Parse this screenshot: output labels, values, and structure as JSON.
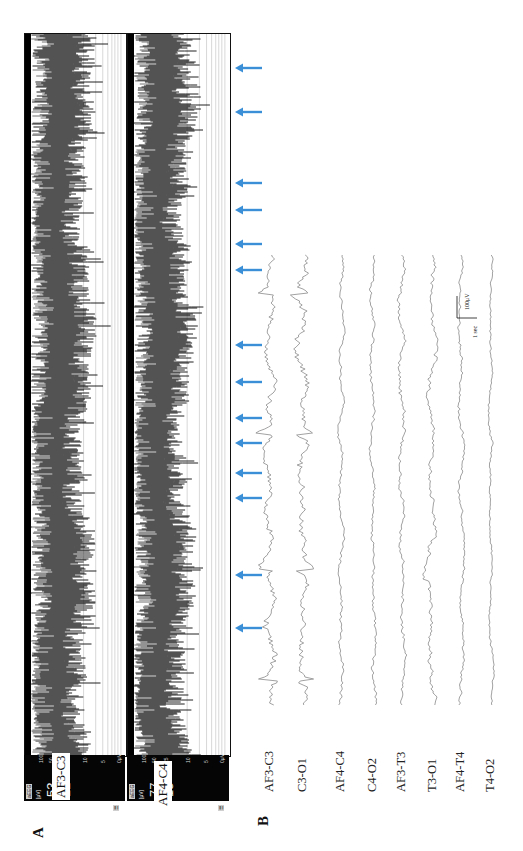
{
  "figure": {
    "panel_a_letter": "A",
    "panel_b_letter": "B",
    "orientation": "rotated -90deg"
  },
  "panel_a": {
    "channels": [
      {
        "id": "aeeg-1",
        "tag": "aEEG",
        "unit": "[μV]",
        "value_top": "53",
        "value_bottom": "12",
        "label": "AF3-C3",
        "icon_tag": "☰"
      },
      {
        "id": "aeeg-2",
        "tag": "aEEG",
        "unit": "[μV]",
        "value_top": "77",
        "value_bottom": "15",
        "label": "AF4-C4",
        "icon_tag": "☰"
      }
    ],
    "axis_ticks": [
      "100",
      "50",
      "25",
      "10",
      "5",
      "0μV"
    ]
  },
  "panel_b": {
    "channels": [
      "AF3-C3",
      "C3-O1",
      "AF4-C4",
      "C4-O2",
      "AF3-T3",
      "T3-O1",
      "AF4-T4",
      "T4-O2"
    ],
    "scale_bar": {
      "amplitude": "100μV",
      "time": "1 sec"
    }
  },
  "markers": {
    "color": "#3a8fd6",
    "arrow_y": [
      68,
      112,
      183,
      210,
      244,
      270,
      345,
      382,
      418,
      443,
      473,
      498,
      575,
      628
    ]
  },
  "chart_data": [
    {
      "type": "area",
      "title": "aEEG AF3-C3",
      "ylabel": "Amplitude (μV, log scale)",
      "y_ticks": [
        0,
        5,
        10,
        25,
        50,
        100
      ],
      "upper_margin_uV": 53,
      "lower_margin_uV": 12,
      "event_markers": 14
    },
    {
      "type": "area",
      "title": "aEEG AF4-C4",
      "ylabel": "Amplitude (μV, log scale)",
      "y_ticks": [
        0,
        5,
        10,
        25,
        50,
        100
      ],
      "upper_margin_uV": 77,
      "lower_margin_uV": 15,
      "event_markers": 14
    },
    {
      "type": "line",
      "title": "Raw EEG",
      "series": [
        {
          "name": "AF3-C3"
        },
        {
          "name": "C3-O1"
        },
        {
          "name": "AF4-C4"
        },
        {
          "name": "C4-O2"
        },
        {
          "name": "AF3-T3"
        },
        {
          "name": "T3-O1"
        },
        {
          "name": "AF4-T4"
        },
        {
          "name": "T4-O2"
        }
      ],
      "scale_bar": {
        "amplitude_uV": 100,
        "time_s": 1
      }
    }
  ]
}
